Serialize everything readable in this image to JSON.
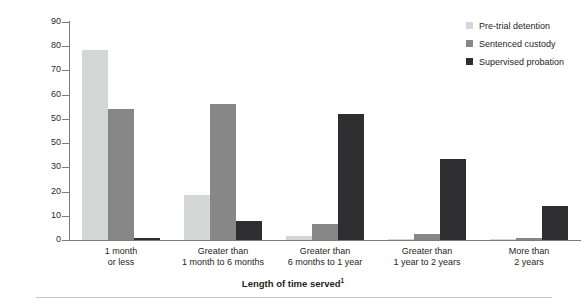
{
  "chart_data": {
    "type": "bar",
    "title": "",
    "xlabel": "Length of time served",
    "xlabel_footnote": "1",
    "ylabel": "Percent of releases",
    "ylim": [
      0,
      90
    ],
    "ytick_values": [
      0,
      10,
      20,
      30,
      40,
      50,
      60,
      70,
      80,
      90
    ],
    "ytick_labels": [
      "0",
      "10",
      "20",
      "30",
      "50",
      "50",
      "60",
      "70",
      "80",
      "90"
    ],
    "grid": false,
    "legend_position": "top-right",
    "categories": [
      "1 month or less",
      "Greater than 1 month to 6 months",
      "Greater than 6 months to 1 year",
      "Greater than 1 year to 2 years",
      "More than 2 years"
    ],
    "category_lines": [
      [
        "1 month",
        "or less"
      ],
      [
        "Greater than",
        "1 month to 6 months"
      ],
      [
        "Greater than",
        "6 months to 1 year"
      ],
      [
        "Greater than",
        "1 year to 2 years"
      ],
      [
        "More than",
        "2 years"
      ]
    ],
    "series": [
      {
        "name": "Pre-trial detention",
        "color": "#d5d6d6",
        "values": [
          78.5,
          18.5,
          1.5,
          0.5,
          0.3
        ]
      },
      {
        "name": "Sentenced custody",
        "color": "#878787",
        "values": [
          54,
          56,
          6.5,
          2.5,
          1
        ]
      },
      {
        "name": "Supervised probation",
        "color": "#2e2d2f",
        "values": [
          1,
          8,
          52,
          33.5,
          14
        ]
      }
    ]
  }
}
